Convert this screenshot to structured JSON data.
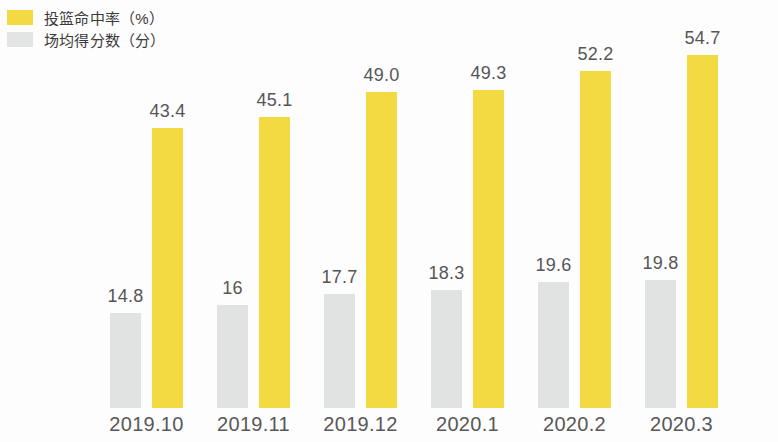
{
  "legend": {
    "items": [
      {
        "label": "投篮命中率（%）",
        "color": "#f4da42",
        "series": "field_goal_pct"
      },
      {
        "label": "场均得分数（分）",
        "color": "#e3e5e4",
        "series": "points_per_game"
      }
    ]
  },
  "chart_data": {
    "type": "bar",
    "title": "",
    "subtitle": "",
    "xlabel": "",
    "ylabel": "",
    "grid": false,
    "legend_position": "top-left",
    "ylim": [
      0,
      57
    ],
    "categories": [
      "2019.10",
      "2019.11",
      "2019.12",
      "2020.1",
      "2020.2",
      "2020.3"
    ],
    "series": [
      {
        "name": "场均得分数（分）",
        "color": "#e1e3e2",
        "values": [
          14.8,
          16,
          17.7,
          18.3,
          19.6,
          19.8
        ],
        "labels": [
          "14.8",
          "16",
          "17.7",
          "18.3",
          "19.6",
          "19.8"
        ]
      },
      {
        "name": "投篮命中率（%）",
        "color": "#f4da42",
        "values": [
          43.4,
          45.1,
          49.0,
          49.3,
          52.2,
          54.7
        ],
        "labels": [
          "43.4",
          "45.1",
          "49.0",
          "49.3",
          "52.2",
          "54.7"
        ]
      }
    ]
  },
  "colors": {
    "background": "#fdfdfd",
    "value_text": "#565656",
    "axis_text": "#585858",
    "legend_text": "#3a3a3a"
  }
}
